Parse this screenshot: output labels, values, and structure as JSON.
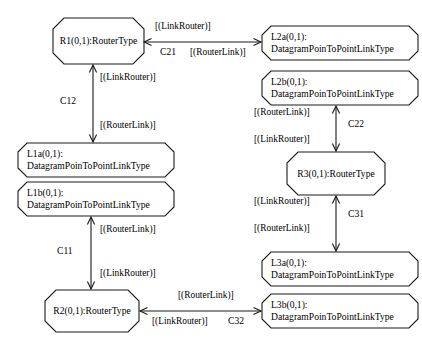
{
  "diagram": {
    "type": "uml-object-diagram",
    "background_color": "#ffffff",
    "line_color": "#1a1a1a",
    "text_color": "#000000",
    "nodes": [
      {
        "id": "R1",
        "name": "router-node-r1",
        "kind": "RouterType",
        "line1": "R1(0,1):RouterType",
        "line2": "",
        "shape": "octagon",
        "x": 53,
        "y": 18,
        "w": 91,
        "h": 46,
        "chamfer": 11,
        "text_align": "center"
      },
      {
        "id": "L2a",
        "name": "link-node-l2a",
        "kind": "DatagramPoinToPointLinkType",
        "line1": "L2a(0,1):",
        "line2": "DatagramPoinToPointLinkType",
        "shape": "octagon",
        "x": 262,
        "y": 26,
        "w": 156,
        "h": 34,
        "chamfer": 9,
        "text_align": "left"
      },
      {
        "id": "L2b",
        "name": "link-node-l2b",
        "kind": "DatagramPoinToPointLinkType",
        "line1": "L2b(0,1):",
        "line2": "DatagramPoinToPointLinkType",
        "shape": "octagon",
        "x": 262,
        "y": 71,
        "w": 156,
        "h": 34,
        "chamfer": 9,
        "text_align": "left"
      },
      {
        "id": "L1a",
        "name": "link-node-l1a",
        "kind": "DatagramPoinToPointLinkType",
        "line1": "L1a(0,1):",
        "line2": "DatagramPoinToPointLinkType",
        "shape": "octagon",
        "x": 18,
        "y": 143,
        "w": 156,
        "h": 34,
        "chamfer": 9,
        "text_align": "left"
      },
      {
        "id": "R3",
        "name": "router-node-r3",
        "kind": "RouterType",
        "line1": "R3(0,1):RouterType",
        "line2": "",
        "shape": "octagon",
        "x": 287,
        "y": 152,
        "w": 98,
        "h": 43,
        "chamfer": 11,
        "text_align": "center"
      },
      {
        "id": "L1b",
        "name": "link-node-l1b",
        "kind": "DatagramPoinToPointLinkType",
        "line1": "L1b(0,1):",
        "line2": "DatagramPoinToPointLinkType",
        "shape": "octagon",
        "x": 18,
        "y": 182,
        "w": 156,
        "h": 34,
        "chamfer": 9,
        "text_align": "left"
      },
      {
        "id": "L3a",
        "name": "link-node-l3a",
        "kind": "DatagramPoinToPointLinkType",
        "line1": "L3a(0,1):",
        "line2": "DatagramPoinToPointLinkType",
        "shape": "octagon",
        "x": 262,
        "y": 252,
        "w": 156,
        "h": 34,
        "chamfer": 9,
        "text_align": "left"
      },
      {
        "id": "R2",
        "name": "router-node-r2",
        "kind": "RouterType",
        "line1": "R2(0,1):RouterType",
        "line2": "",
        "shape": "octagon",
        "x": 45,
        "y": 290,
        "w": 94,
        "h": 42,
        "chamfer": 11,
        "text_align": "center"
      },
      {
        "id": "L3b",
        "name": "link-node-l3b",
        "kind": "DatagramPoinToPointLinkType",
        "line1": "L3b(0,1):",
        "line2": "DatagramPoinToPointLinkType",
        "shape": "octagon",
        "x": 262,
        "y": 294,
        "w": 156,
        "h": 34,
        "chamfer": 9,
        "text_align": "left"
      }
    ],
    "edges": [
      {
        "id": "C21",
        "name": "association-c21",
        "label": "C21",
        "from": "R1",
        "to": "L2a",
        "orientation": "horizontal",
        "x1": 144,
        "y1": 42,
        "x2": 261,
        "y2": 42,
        "role_a": "[(LinkRouter)]",
        "role_b": "[(RouterLink)]",
        "role_a_x": 155,
        "role_a_y": 21,
        "role_b_x": 190,
        "role_b_y": 47,
        "label_x": 160,
        "label_y": 47
      },
      {
        "id": "C12",
        "name": "association-c12",
        "label": "C12",
        "from": "R1",
        "to": "L1a",
        "orientation": "vertical",
        "x1": 93,
        "y1": 65,
        "x2": 93,
        "y2": 142,
        "role_a": "[(LinkRouter)]",
        "role_b": "[(RouterLink)]",
        "role_a_x": 100,
        "role_a_y": 72,
        "role_b_x": 100,
        "role_b_y": 120,
        "label_x": 60,
        "label_y": 96
      },
      {
        "id": "C22",
        "name": "association-c22",
        "label": "C22",
        "from": "L2b",
        "to": "R3",
        "orientation": "vertical",
        "x1": 336,
        "y1": 106,
        "x2": 336,
        "y2": 151,
        "role_a": "[(RouterLink)]",
        "role_b": "[(LinkRouter)]",
        "role_a_x": 254,
        "role_a_y": 107,
        "role_b_x": 254,
        "role_b_y": 134,
        "label_x": 348,
        "label_y": 119
      },
      {
        "id": "C31",
        "name": "association-c31",
        "label": "C31",
        "from": "R3",
        "to": "L3a",
        "orientation": "vertical",
        "x1": 336,
        "y1": 196,
        "x2": 336,
        "y2": 251,
        "role_a": "[(LinkRouter)]",
        "role_b": "[(RouterLink)]",
        "role_a_x": 254,
        "role_a_y": 196,
        "role_b_x": 254,
        "role_b_y": 223,
        "label_x": 348,
        "label_y": 209
      },
      {
        "id": "C11",
        "name": "association-c11",
        "label": "C11",
        "from": "L1b",
        "to": "R2",
        "orientation": "vertical",
        "x1": 91,
        "y1": 217,
        "x2": 91,
        "y2": 289,
        "role_a": "[(RouterLink)]",
        "role_b": "[(LinkRouter)]",
        "role_a_x": 100,
        "role_a_y": 224,
        "role_b_x": 100,
        "role_b_y": 268,
        "label_x": 57,
        "label_y": 246
      },
      {
        "id": "C32",
        "name": "association-c32",
        "label": "C32",
        "from": "L3b",
        "to": "R2",
        "orientation": "horizontal",
        "x1": 140,
        "y1": 311,
        "x2": 261,
        "y2": 311,
        "role_a": "[(RouterLink)]",
        "role_b": "[(LinkRouter)]",
        "role_a_x": 178,
        "role_a_y": 290,
        "role_b_x": 152,
        "role_b_y": 316,
        "label_x": 228,
        "label_y": 316
      }
    ]
  }
}
